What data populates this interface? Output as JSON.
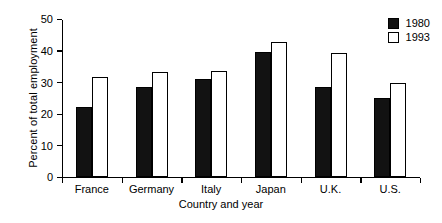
{
  "chart_data": {
    "type": "bar",
    "title": "",
    "xlabel": "Country and year",
    "ylabel": "Percent of total employment",
    "categories": [
      "France",
      "Germany",
      "Italy",
      "Japan",
      "U.K.",
      "U.S."
    ],
    "series": [
      {
        "name": "1980",
        "color": "#121212",
        "values": [
          22,
          28.5,
          31,
          39.5,
          28.5,
          25
        ]
      },
      {
        "name": "1993",
        "color": "#ffffff",
        "values": [
          31.5,
          33,
          33.5,
          42.5,
          39,
          29.5
        ]
      }
    ],
    "ylim": [
      0,
      50
    ],
    "yticks": [
      0,
      10,
      20,
      30,
      40,
      50
    ],
    "ytick_labels": [
      "0",
      "10",
      "20",
      "30",
      "40",
      "50"
    ],
    "grid": false,
    "legend_position": "top-right"
  },
  "legend": {
    "entries": [
      {
        "label": "1980"
      },
      {
        "label": "1993"
      }
    ]
  }
}
